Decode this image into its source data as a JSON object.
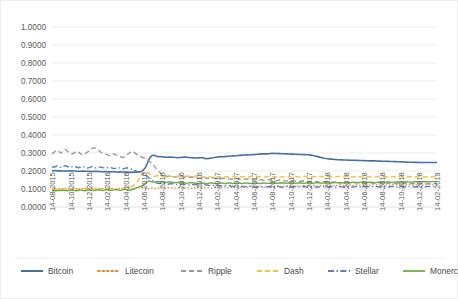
{
  "chart_data": {
    "type": "line",
    "title": "",
    "subtitle": "",
    "xlabel": "",
    "ylabel": "",
    "ylim": [
      0.0,
      1.0
    ],
    "ytick_labels": [
      "0.0000",
      "0.1000",
      "0.2000",
      "0.3000",
      "0.4000",
      "0.5000",
      "0.6000",
      "0.7000",
      "0.8000",
      "0.9000",
      "1.0000"
    ],
    "ytick_values": [
      0.0,
      0.1,
      0.2,
      0.3,
      0.4,
      0.5,
      0.6,
      0.7,
      0.8,
      0.9,
      1.0
    ],
    "grid": true,
    "legend_position": "bottom",
    "x_tick_labels": [
      "14-08-2015",
      "14-10-2015",
      "14-12-2015",
      "14-02-2016",
      "14-04-2016",
      "14-06-2016",
      "14-08-2016",
      "14-10-2016",
      "14-12-2016",
      "14-02-2017",
      "14-04-2017",
      "14-06-2017",
      "14-08-2017",
      "14-10-2017",
      "14-12-2017",
      "14-02-2018",
      "14-04-2018",
      "14-06-2018",
      "14-08-2018",
      "14-10-2018",
      "14-12-2018",
      "14-02-2019"
    ],
    "series": [
      {
        "name": "Bitcoin",
        "color": "#4472a8",
        "style": "solid",
        "width": 1.6,
        "values": [
          0.2,
          0.202,
          0.201,
          0.2005,
          0.2015,
          0.2,
          0.1995,
          0.2,
          0.201,
          0.2005,
          0.2,
          0.199,
          0.1985,
          0.199,
          0.1995,
          0.199,
          0.1985,
          0.198,
          0.1975,
          0.198,
          0.1985,
          0.1975,
          0.1965,
          0.196,
          0.1965,
          0.1955,
          0.195,
          0.196,
          0.1955,
          0.1945,
          0.194,
          0.195,
          0.1945,
          0.194,
          0.1935,
          0.193,
          0.1925,
          0.1935,
          0.193,
          0.194,
          0.195,
          0.202,
          0.215,
          0.24,
          0.27,
          0.285,
          0.288,
          0.283,
          0.279,
          0.28,
          0.279,
          0.277,
          0.276,
          0.277,
          0.278,
          0.276,
          0.275,
          0.274,
          0.275,
          0.276,
          0.277,
          0.276,
          0.275,
          0.274,
          0.273,
          0.272,
          0.273,
          0.274,
          0.275,
          0.27,
          0.268,
          0.27,
          0.272,
          0.274,
          0.276,
          0.278,
          0.28,
          0.279,
          0.28,
          0.281,
          0.282,
          0.283,
          0.284,
          0.285,
          0.286,
          0.287,
          0.288,
          0.289,
          0.29,
          0.289,
          0.29,
          0.291,
          0.292,
          0.293,
          0.294,
          0.295,
          0.296,
          0.295,
          0.296,
          0.297,
          0.298,
          0.2975,
          0.297,
          0.2965,
          0.296,
          0.2955,
          0.295,
          0.2945,
          0.294,
          0.2935,
          0.293,
          0.2925,
          0.292,
          0.2915,
          0.291,
          0.2905,
          0.29,
          0.288,
          0.286,
          0.283,
          0.28,
          0.277,
          0.274,
          0.271,
          0.269,
          0.267,
          0.266,
          0.265,
          0.264,
          0.263,
          0.2625,
          0.262,
          0.2615,
          0.261,
          0.2605,
          0.26,
          0.26,
          0.2595,
          0.259,
          0.2585,
          0.258,
          0.2575,
          0.257,
          0.257,
          0.2565,
          0.256,
          0.256,
          0.2555,
          0.255,
          0.2545,
          0.254,
          0.254,
          0.2535,
          0.253,
          0.2525,
          0.252,
          0.2515,
          0.251,
          0.2505,
          0.25,
          0.2495,
          0.249,
          0.249,
          0.2485,
          0.248,
          0.248,
          0.2475,
          0.247,
          0.247,
          0.247,
          0.247,
          0.247,
          0.247,
          0.247,
          0.247
        ]
      },
      {
        "name": "Litecoin",
        "color": "#e08a3c",
        "style": "dotted",
        "width": 1.3,
        "values": [
          0.095,
          0.098,
          0.096,
          0.1,
          0.099,
          0.102,
          0.1,
          0.098,
          0.101,
          0.1,
          0.099,
          0.102,
          0.1,
          0.103,
          0.101,
          0.099,
          0.1,
          0.102,
          0.104,
          0.101,
          0.1,
          0.103,
          0.105,
          0.102,
          0.1,
          0.103,
          0.101,
          0.104,
          0.102,
          0.1,
          0.103,
          0.105,
          0.102,
          0.1,
          0.104,
          0.106,
          0.103,
          0.1,
          0.105,
          0.108,
          0.11,
          0.106,
          0.103,
          0.1,
          0.103,
          0.106,
          0.104,
          0.102,
          0.105,
          0.107,
          0.104,
          0.102,
          0.105,
          0.108,
          0.106,
          0.103,
          0.105,
          0.107,
          0.105,
          0.103,
          0.106,
          0.108,
          0.105,
          0.103,
          0.106,
          0.108,
          0.11,
          0.107,
          0.105,
          0.108,
          0.11,
          0.107,
          0.105,
          0.108,
          0.111,
          0.108,
          0.106,
          0.109,
          0.111,
          0.108,
          0.106,
          0.109,
          0.112,
          0.109,
          0.107,
          0.11,
          0.113,
          0.11,
          0.108,
          0.111,
          0.114,
          0.111,
          0.109,
          0.112,
          0.115,
          0.112,
          0.11,
          0.113,
          0.116,
          0.113,
          0.111,
          0.114,
          0.117,
          0.114,
          0.112,
          0.115,
          0.118,
          0.115,
          0.113,
          0.116,
          0.119,
          0.116,
          0.114,
          0.117,
          0.12,
          0.117,
          0.115,
          0.118,
          0.121,
          0.118,
          0.116,
          0.119,
          0.122,
          0.119,
          0.117,
          0.12,
          0.123,
          0.12,
          0.118,
          0.121,
          0.124,
          0.121,
          0.119,
          0.122,
          0.125,
          0.122,
          0.12,
          0.123,
          0.125,
          0.122,
          0.12,
          0.123,
          0.125,
          0.122,
          0.121,
          0.124,
          0.126,
          0.123,
          0.121,
          0.124,
          0.126,
          0.123,
          0.121,
          0.124,
          0.126,
          0.123,
          0.121,
          0.124,
          0.126,
          0.123,
          0.121,
          0.124,
          0.126,
          0.123,
          0.121,
          0.124,
          0.126,
          0.123,
          0.122,
          0.124,
          0.125,
          0.124,
          0.123,
          0.124,
          0.125
        ]
      },
      {
        "name": "Ripple",
        "color": "#9b9b9b",
        "style": "dashed",
        "width": 1.4,
        "values": [
          0.295,
          0.305,
          0.315,
          0.31,
          0.3,
          0.31,
          0.32,
          0.31,
          0.3,
          0.295,
          0.3,
          0.31,
          0.305,
          0.295,
          0.29,
          0.295,
          0.305,
          0.315,
          0.325,
          0.33,
          0.325,
          0.315,
          0.305,
          0.3,
          0.295,
          0.29,
          0.285,
          0.29,
          0.295,
          0.29,
          0.285,
          0.28,
          0.275,
          0.28,
          0.29,
          0.3,
          0.31,
          0.305,
          0.295,
          0.285,
          0.28,
          0.275,
          0.27,
          0.265,
          0.255,
          0.245,
          0.23,
          0.215,
          0.2,
          0.19,
          0.18,
          0.175,
          0.17,
          0.172,
          0.17,
          0.168,
          0.166,
          0.168,
          0.17,
          0.168,
          0.165,
          0.163,
          0.165,
          0.167,
          0.165,
          0.162,
          0.16,
          0.162,
          0.164,
          0.162,
          0.16,
          0.158,
          0.16,
          0.162,
          0.16,
          0.158,
          0.156,
          0.158,
          0.16,
          0.158,
          0.156,
          0.154,
          0.156,
          0.158,
          0.156,
          0.154,
          0.152,
          0.154,
          0.156,
          0.154,
          0.152,
          0.15,
          0.152,
          0.154,
          0.152,
          0.15,
          0.148,
          0.15,
          0.152,
          0.15,
          0.148,
          0.146,
          0.148,
          0.15,
          0.148,
          0.146,
          0.144,
          0.146,
          0.148,
          0.146,
          0.144,
          0.142,
          0.144,
          0.146,
          0.144,
          0.142,
          0.14,
          0.142,
          0.144,
          0.142,
          0.14,
          0.138,
          0.14,
          0.142,
          0.14,
          0.138,
          0.136,
          0.138,
          0.14,
          0.138,
          0.136,
          0.134,
          0.136,
          0.138,
          0.136,
          0.134,
          0.133,
          0.135,
          0.137,
          0.135,
          0.133,
          0.132,
          0.134,
          0.136,
          0.134,
          0.132,
          0.131,
          0.133,
          0.135,
          0.133,
          0.131,
          0.13,
          0.132,
          0.134,
          0.132,
          0.13,
          0.129,
          0.131,
          0.133,
          0.131,
          0.129,
          0.128,
          0.13,
          0.132,
          0.13,
          0.129,
          0.128,
          0.13,
          0.131,
          0.13,
          0.129,
          0.13,
          0.131,
          0.13,
          0.13
        ]
      },
      {
        "name": "Dash",
        "color": "#f5c242",
        "style": "dashed",
        "width": 1.5,
        "values": [
          0.1,
          0.102,
          0.1,
          0.098,
          0.1,
          0.102,
          0.104,
          0.101,
          0.099,
          0.101,
          0.103,
          0.1,
          0.098,
          0.1,
          0.102,
          0.104,
          0.101,
          0.099,
          0.101,
          0.103,
          0.105,
          0.102,
          0.1,
          0.102,
          0.104,
          0.101,
          0.099,
          0.101,
          0.103,
          0.1,
          0.098,
          0.1,
          0.102,
          0.105,
          0.108,
          0.11,
          0.115,
          0.12,
          0.13,
          0.15,
          0.17,
          0.19,
          0.2,
          0.195,
          0.185,
          0.175,
          0.17,
          0.172,
          0.175,
          0.172,
          0.17,
          0.168,
          0.17,
          0.173,
          0.17,
          0.168,
          0.17,
          0.172,
          0.17,
          0.168,
          0.17,
          0.172,
          0.17,
          0.168,
          0.17,
          0.172,
          0.17,
          0.168,
          0.166,
          0.168,
          0.17,
          0.168,
          0.166,
          0.168,
          0.17,
          0.168,
          0.166,
          0.168,
          0.17,
          0.168,
          0.166,
          0.168,
          0.17,
          0.168,
          0.166,
          0.168,
          0.17,
          0.168,
          0.166,
          0.168,
          0.17,
          0.168,
          0.166,
          0.168,
          0.17,
          0.168,
          0.166,
          0.168,
          0.17,
          0.168,
          0.166,
          0.168,
          0.17,
          0.168,
          0.166,
          0.168,
          0.17,
          0.168,
          0.166,
          0.168,
          0.17,
          0.168,
          0.166,
          0.168,
          0.17,
          0.168,
          0.167,
          0.169,
          0.17,
          0.168,
          0.167,
          0.169,
          0.17,
          0.168,
          0.167,
          0.169,
          0.17,
          0.168,
          0.167,
          0.169,
          0.17,
          0.168,
          0.167,
          0.169,
          0.17,
          0.168,
          0.167,
          0.168,
          0.17,
          0.168,
          0.167,
          0.168,
          0.169,
          0.168,
          0.167,
          0.168,
          0.169,
          0.168,
          0.167,
          0.168,
          0.169,
          0.168,
          0.167,
          0.168,
          0.169,
          0.168,
          0.167,
          0.168,
          0.169,
          0.168,
          0.167,
          0.168,
          0.169,
          0.168,
          0.167,
          0.168,
          0.169,
          0.168,
          0.167,
          0.168,
          0.168,
          0.167,
          0.168,
          0.168,
          0.168
        ]
      },
      {
        "name": "Stellar",
        "color": "#5b7fc7",
        "style": "dashdot",
        "width": 1.4,
        "values": [
          0.225,
          0.22,
          0.228,
          0.223,
          0.22,
          0.225,
          0.23,
          0.225,
          0.22,
          0.223,
          0.226,
          0.222,
          0.218,
          0.222,
          0.225,
          0.22,
          0.216,
          0.22,
          0.224,
          0.22,
          0.216,
          0.22,
          0.223,
          0.219,
          0.215,
          0.218,
          0.221,
          0.217,
          0.213,
          0.216,
          0.219,
          0.215,
          0.211,
          0.215,
          0.218,
          0.214,
          0.21,
          0.206,
          0.2,
          0.195,
          0.19,
          0.185,
          0.18,
          0.17,
          0.16,
          0.15,
          0.14,
          0.135,
          0.13,
          0.132,
          0.13,
          0.128,
          0.126,
          0.128,
          0.13,
          0.128,
          0.126,
          0.124,
          0.126,
          0.128,
          0.126,
          0.124,
          0.122,
          0.124,
          0.126,
          0.124,
          0.122,
          0.12,
          0.122,
          0.124,
          0.122,
          0.12,
          0.118,
          0.12,
          0.122,
          0.12,
          0.118,
          0.116,
          0.118,
          0.12,
          0.118,
          0.116,
          0.114,
          0.116,
          0.118,
          0.116,
          0.114,
          0.112,
          0.114,
          0.116,
          0.114,
          0.112,
          0.11,
          0.112,
          0.114,
          0.112,
          0.11,
          0.112,
          0.114,
          0.112,
          0.11,
          0.112,
          0.114,
          0.112,
          0.11,
          0.112,
          0.114,
          0.112,
          0.11,
          0.112,
          0.114,
          0.112,
          0.11,
          0.112,
          0.114,
          0.112,
          0.11,
          0.112,
          0.114,
          0.112,
          0.11,
          0.112,
          0.114,
          0.112,
          0.11,
          0.112,
          0.114,
          0.112,
          0.11,
          0.112,
          0.114,
          0.112,
          0.11,
          0.112,
          0.114,
          0.112,
          0.111,
          0.113,
          0.115,
          0.113,
          0.111,
          0.113,
          0.115,
          0.113,
          0.111,
          0.113,
          0.115,
          0.113,
          0.111,
          0.113,
          0.115,
          0.113,
          0.111,
          0.113,
          0.115,
          0.113,
          0.111,
          0.113,
          0.115,
          0.113,
          0.111,
          0.113,
          0.115,
          0.113,
          0.111,
          0.113,
          0.114,
          0.113,
          0.112,
          0.113,
          0.114,
          0.113,
          0.113,
          0.114,
          0.114
        ]
      },
      {
        "name": "Monero",
        "color": "#70ad47",
        "style": "solid",
        "width": 1.4,
        "values": [
          0.09,
          0.092,
          0.09,
          0.093,
          0.091,
          0.094,
          0.092,
          0.09,
          0.093,
          0.095,
          0.092,
          0.09,
          0.093,
          0.095,
          0.092,
          0.09,
          0.093,
          0.096,
          0.093,
          0.091,
          0.094,
          0.096,
          0.093,
          0.091,
          0.094,
          0.097,
          0.094,
          0.092,
          0.095,
          0.097,
          0.094,
          0.092,
          0.095,
          0.098,
          0.095,
          0.093,
          0.096,
          0.1,
          0.105,
          0.11,
          0.115,
          0.12,
          0.13,
          0.14,
          0.145,
          0.14,
          0.138,
          0.14,
          0.142,
          0.14,
          0.138,
          0.136,
          0.138,
          0.14,
          0.138,
          0.136,
          0.134,
          0.136,
          0.138,
          0.136,
          0.134,
          0.132,
          0.134,
          0.136,
          0.134,
          0.132,
          0.13,
          0.132,
          0.134,
          0.132,
          0.13,
          0.132,
          0.134,
          0.132,
          0.13,
          0.132,
          0.134,
          0.132,
          0.13,
          0.132,
          0.134,
          0.132,
          0.13,
          0.132,
          0.134,
          0.132,
          0.13,
          0.132,
          0.134,
          0.132,
          0.13,
          0.132,
          0.134,
          0.132,
          0.13,
          0.132,
          0.134,
          0.132,
          0.131,
          0.133,
          0.135,
          0.133,
          0.131,
          0.133,
          0.135,
          0.133,
          0.131,
          0.133,
          0.135,
          0.133,
          0.131,
          0.133,
          0.135,
          0.133,
          0.132,
          0.134,
          0.136,
          0.134,
          0.132,
          0.134,
          0.136,
          0.134,
          0.132,
          0.134,
          0.136,
          0.134,
          0.133,
          0.135,
          0.137,
          0.135,
          0.133,
          0.135,
          0.137,
          0.135,
          0.134,
          0.136,
          0.138,
          0.136,
          0.134,
          0.136,
          0.138,
          0.136,
          0.135,
          0.137,
          0.139,
          0.137,
          0.135,
          0.137,
          0.139,
          0.137,
          0.136,
          0.138,
          0.14,
          0.138,
          0.136,
          0.138,
          0.14,
          0.138,
          0.137,
          0.139,
          0.14,
          0.139,
          0.138,
          0.139,
          0.141,
          0.14,
          0.139,
          0.14,
          0.141,
          0.14,
          0.14,
          0.141,
          0.141,
          0.141,
          0.141
        ]
      }
    ]
  },
  "legend": {
    "items": [
      {
        "label": "Bitcoin"
      },
      {
        "label": "Litecoin"
      },
      {
        "label": "Ripple"
      },
      {
        "label": "Dash"
      },
      {
        "label": "Stellar"
      },
      {
        "label": "Monero"
      }
    ]
  }
}
